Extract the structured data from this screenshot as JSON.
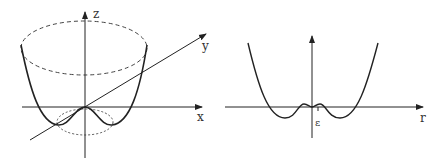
{
  "figure": {
    "left_panel": {
      "title": "3D double-well potential surface",
      "axes": {
        "z_label": "z",
        "x_label": "x",
        "y_label": "y"
      },
      "colors": {
        "stroke": "#222222",
        "dashed": "#444444"
      }
    },
    "right_panel": {
      "title": "Radial cross-section of potential",
      "axes": {
        "x_label": "r",
        "marker_label": "ε"
      },
      "colors": {
        "stroke": "#222222"
      }
    }
  }
}
